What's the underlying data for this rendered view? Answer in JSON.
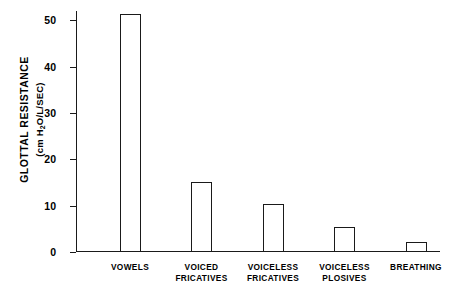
{
  "chart_data": {
    "type": "bar",
    "title": "",
    "subtitle": "",
    "xlabel": "",
    "ylabel_line1": "GLOTTAL RESISTANCE",
    "ylabel_line2_prefix": "(cm H",
    "ylabel_line2_sub": "2",
    "ylabel_line2_suffix": "O/L/SEC)",
    "categories": [
      "VOWELS",
      "VOICED\nFRICATIVES",
      "VOICELESS\nFRICATIVES",
      "VOICELESS\nPLOSIVES",
      "BREATHING"
    ],
    "values": [
      51.3,
      15.0,
      10.3,
      5.4,
      2.1
    ],
    "ylim": [
      0,
      52
    ],
    "yticks": [
      0,
      10,
      20,
      30,
      40,
      50
    ],
    "ytick_labels": [
      "0",
      "10",
      "20",
      "30",
      "40",
      "50"
    ],
    "grid": false,
    "legend": false,
    "bar_fill_color": "#ffffff",
    "bar_edge_color": "#1a1a1a",
    "axis_color": "#1a1a1a",
    "background_color": "#ffffff"
  }
}
